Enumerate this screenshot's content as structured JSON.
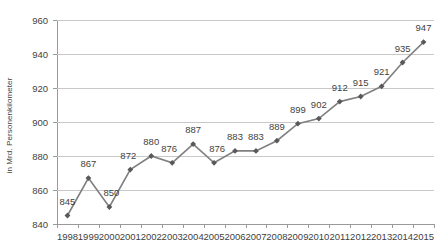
{
  "chart_data": {
    "type": "line",
    "title": "",
    "subtitle": "",
    "xlabel": "",
    "ylabel": "in Mrd. Personenkilometer",
    "categories": [
      "1998",
      "1999",
      "2000",
      "2001",
      "2002",
      "2003",
      "2004",
      "2005",
      "2006",
      "2007",
      "2008",
      "2009",
      "2010",
      "2011",
      "2012",
      "2013",
      "2014",
      "2015"
    ],
    "values": [
      845,
      867,
      850,
      872,
      880,
      876,
      887,
      876,
      883,
      883,
      889,
      899,
      902,
      912,
      915,
      921,
      935,
      947
    ],
    "data_labels": [
      "845",
      "867",
      "850",
      "872",
      "880",
      "876",
      "887",
      "876",
      "883",
      "883",
      "889",
      "899",
      "902",
      "912",
      "915",
      "921",
      "935",
      "947"
    ],
    "ylim": [
      840,
      960
    ],
    "yticks": [
      840,
      860,
      880,
      900,
      920,
      940,
      960
    ],
    "ytick_labels": [
      "840",
      "860",
      "880",
      "900",
      "920",
      "940",
      "960"
    ],
    "grid": true,
    "legend": null,
    "legend_position": "none",
    "series_color": "#808080",
    "marker": "diamond",
    "marker_color": "#595959",
    "gridline_color": "#c8c8c8",
    "axis_color": "#9a9a9a",
    "label_offsets": [
      {
        "dx": 0,
        "dy": -9
      },
      {
        "dx": 0,
        "dy": -9
      },
      {
        "dx": 2,
        "dy": -9
      },
      {
        "dx": -2,
        "dy": -9
      },
      {
        "dx": 0,
        "dy": -9
      },
      {
        "dx": -3,
        "dy": -9
      },
      {
        "dx": 0,
        "dy": -9
      },
      {
        "dx": 3,
        "dy": -9
      },
      {
        "dx": 0,
        "dy": -9
      },
      {
        "dx": 0,
        "dy": -9
      },
      {
        "dx": 0,
        "dy": -9
      },
      {
        "dx": 0,
        "dy": -9
      },
      {
        "dx": 0,
        "dy": -9
      },
      {
        "dx": 0,
        "dy": -9
      },
      {
        "dx": 0,
        "dy": -9
      },
      {
        "dx": 0,
        "dy": -9
      },
      {
        "dx": 0,
        "dy": -9
      },
      {
        "dx": 0,
        "dy": -9
      }
    ]
  }
}
